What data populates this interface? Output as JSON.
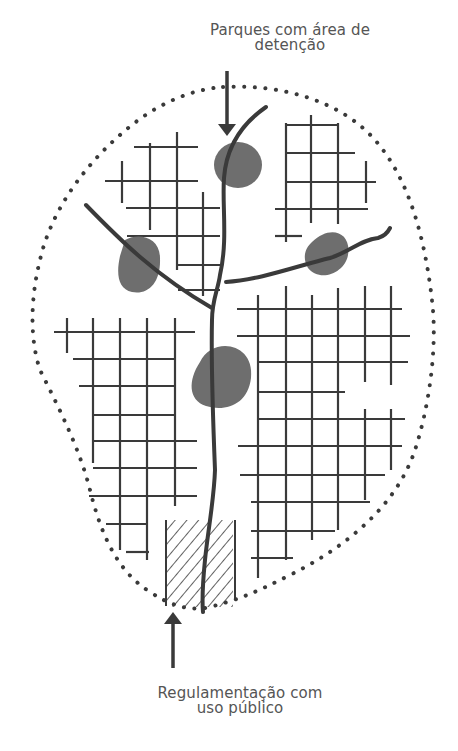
{
  "diagram": {
    "labels": {
      "top": {
        "line1": "Parques com área de",
        "line2": "detenção"
      },
      "bottom": {
        "line1": "Regulamentação com",
        "line2": "uso público"
      }
    },
    "colors": {
      "line": "#3a3a3a",
      "park_fill": "#6e6e6e",
      "text": "#555555",
      "background": "#ffffff"
    },
    "elements": {
      "watershed_boundary": "dotted-outline",
      "river": "main-channel-with-tributaries",
      "detention_parks": 4,
      "urban_blocks": 4,
      "hatched_area": "public-use-regulation-zone",
      "arrows": [
        "top-arrow-to-park",
        "bottom-arrow-to-hatched-zone"
      ]
    }
  }
}
